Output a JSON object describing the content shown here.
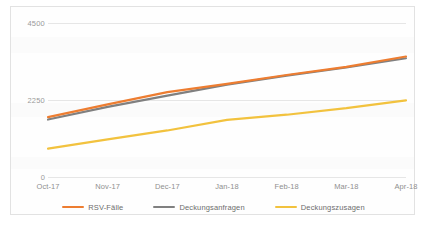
{
  "chart_data": {
    "type": "line",
    "title": "",
    "subtitle": "",
    "xlabel": "",
    "ylabel": "",
    "categories": [
      "Oct-17",
      "Nov-17",
      "Dec-17",
      "Jan-18",
      "Feb-18",
      "Mar-18",
      "Apr-18"
    ],
    "ylim": [
      0,
      4500
    ],
    "y_ticks": [
      "0",
      "2250",
      "4500"
    ],
    "y_tick_values": [
      0,
      2250,
      4500
    ],
    "grid": true,
    "legend_position": "bottom",
    "series": [
      {
        "name": "RSV-Fälle",
        "color": "#ED7D31",
        "values": [
          1750,
          2120,
          2480,
          2720,
          2980,
          3220,
          3520
        ]
      },
      {
        "name": "Deckungsanfragen",
        "color": "#808080",
        "values": [
          1680,
          2050,
          2380,
          2700,
          2960,
          3200,
          3470
        ]
      },
      {
        "name": "Deckungszusagen",
        "color": "#F2C23E",
        "values": [
          830,
          1100,
          1360,
          1670,
          1820,
          2010,
          2240
        ]
      }
    ]
  },
  "axes": {
    "y_labels": [
      "4500",
      "2250",
      "0"
    ],
    "x_labels": [
      "Oct-17",
      "Nov-17",
      "Dec-17",
      "Jan-18",
      "Feb-18",
      "Mar-18",
      "Apr-18"
    ]
  },
  "legend": {
    "items": [
      {
        "label": "RSV-Fälle",
        "color": "#ED7D31"
      },
      {
        "label": "Deckungsanfragen",
        "color": "#808080"
      },
      {
        "label": "Deckungszusagen",
        "color": "#F2C23E"
      }
    ]
  }
}
